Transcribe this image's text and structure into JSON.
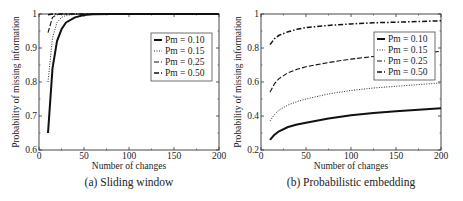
{
  "chart_data": [
    {
      "type": "line",
      "caption": "(a) Sliding window",
      "title": "",
      "xlabel": "Number of changes",
      "ylabel": "Probability of missing information",
      "xlim": [
        0,
        200
      ],
      "ylim": [
        0.6,
        1.0
      ],
      "xticks": [
        "0",
        "50",
        "100",
        "150",
        "200"
      ],
      "yticks": [
        "0.6",
        "0.7",
        "0.8",
        "0.9",
        "1"
      ],
      "grid": false,
      "legend_position": "upper right",
      "x": [
        10,
        15,
        20,
        25,
        30,
        40,
        50,
        60,
        80,
        100,
        150,
        200
      ],
      "series": [
        {
          "name": "Pm = 0.10",
          "style": "solid-thick",
          "values": [
            0.65,
            0.84,
            0.92,
            0.955,
            0.975,
            0.99,
            0.997,
            0.999,
            1.0,
            1.0,
            1.0,
            1.0
          ]
        },
        {
          "name": "Pm = 0.15",
          "style": "dotted",
          "values": [
            0.8,
            0.93,
            0.975,
            0.99,
            0.996,
            0.999,
            1.0,
            1.0,
            1.0,
            1.0,
            1.0,
            1.0
          ]
        },
        {
          "name": "Pm = 0.25",
          "style": "dashed",
          "values": [
            0.945,
            0.99,
            0.998,
            1.0,
            1.0,
            1.0,
            1.0,
            1.0,
            1.0,
            1.0,
            1.0,
            1.0
          ]
        },
        {
          "name": "Pm = 0.50",
          "style": "dash-dot",
          "values": [
            0.998,
            1.0,
            1.0,
            1.0,
            1.0,
            1.0,
            1.0,
            1.0,
            1.0,
            1.0,
            1.0,
            1.0
          ]
        }
      ]
    },
    {
      "type": "line",
      "caption": "(b) Probabilistic embedding",
      "title": "",
      "xlabel": "Number of changes",
      "ylabel": "Probability of missing information",
      "xlim": [
        0,
        200
      ],
      "ylim": [
        0.2,
        1.0
      ],
      "xticks": [
        "0",
        "50",
        "100",
        "150",
        "200"
      ],
      "yticks": [
        "0.2",
        "0.4",
        "0.6",
        "0.8",
        "1"
      ],
      "grid": false,
      "legend_position": "upper right",
      "x": [
        10,
        15,
        20,
        30,
        40,
        50,
        75,
        100,
        125,
        150,
        175,
        200
      ],
      "series": [
        {
          "name": "Pm = 0.10",
          "style": "solid-thick",
          "values": [
            0.26,
            0.29,
            0.31,
            0.335,
            0.35,
            0.36,
            0.385,
            0.405,
            0.418,
            0.428,
            0.437,
            0.445
          ]
        },
        {
          "name": "Pm = 0.15",
          "style": "dotted",
          "values": [
            0.37,
            0.41,
            0.435,
            0.465,
            0.485,
            0.5,
            0.53,
            0.55,
            0.565,
            0.575,
            0.585,
            0.595
          ]
        },
        {
          "name": "Pm = 0.25",
          "style": "dashed",
          "values": [
            0.54,
            0.59,
            0.62,
            0.655,
            0.675,
            0.69,
            0.715,
            0.735,
            0.75,
            0.76,
            0.77,
            0.78
          ]
        },
        {
          "name": "Pm = 0.50",
          "style": "dash-dot",
          "values": [
            0.82,
            0.855,
            0.875,
            0.895,
            0.91,
            0.92,
            0.933,
            0.942,
            0.948,
            0.952,
            0.956,
            0.96
          ]
        }
      ]
    }
  ]
}
